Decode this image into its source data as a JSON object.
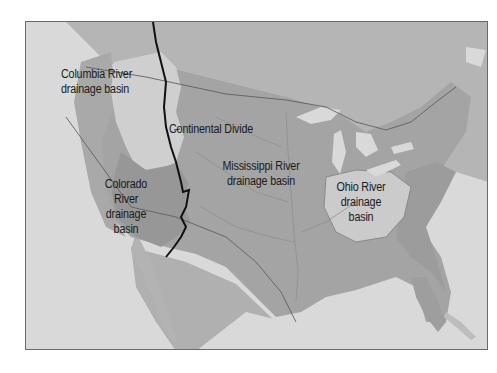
{
  "map": {
    "title": "",
    "region": "United States drainage basins",
    "colors": {
      "water": "#d9d9d9",
      "land_outside": "#b8b8b8",
      "mississippi_basin": "#a3a3a3",
      "colorado_basin": "#999999",
      "columbia_basin": "#cdcdcd",
      "ohio_basin": "#c9c9c9",
      "continental_divide": "#111111",
      "border": "#555555"
    },
    "labels": {
      "columbia": {
        "line1": "Columbia River",
        "line2": "drainage basin"
      },
      "divide": "Continental Divide",
      "mississippi": {
        "line1": "Mississippi River",
        "line2": "drainage basin"
      },
      "colorado": {
        "line1": "Colorado",
        "line2": "River",
        "line3": "drainage",
        "line4": "basin"
      },
      "ohio": {
        "line1": "Ohio River",
        "line2": "drainage",
        "line3": "basin"
      }
    }
  }
}
